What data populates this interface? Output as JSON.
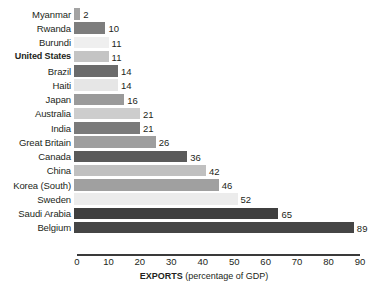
{
  "chart_data": {
    "type": "bar",
    "orientation": "horizontal",
    "title": "",
    "subtitle": "",
    "xlabel": "EXPORTS (percentage of GDP)",
    "xlabel_bold_part": "EXPORTS",
    "xlabel_plain_part": " (percentage of GDP)",
    "ylabel": "",
    "xlim": [
      0,
      90
    ],
    "xticks": [
      0,
      10,
      20,
      30,
      40,
      50,
      60,
      70,
      80,
      90
    ],
    "xtick_labels": [
      "0",
      "10",
      "20",
      "30",
      "40",
      "50",
      "60",
      "70",
      "80",
      "90"
    ],
    "grid": false,
    "legend": false,
    "categories": [
      "Myanmar",
      "Rwanda",
      "Burundi",
      "United States",
      "Brazil",
      "Haiti",
      "Japan",
      "Australia",
      "India",
      "Great Britain",
      "Canada",
      "China",
      "Korea (South)",
      "Sweden",
      "Saudi Arabia",
      "Belgium"
    ],
    "values": [
      2,
      10,
      11,
      11,
      14,
      14,
      16,
      21,
      21,
      26,
      36,
      42,
      46,
      52,
      65,
      89
    ],
    "value_labels": [
      "2",
      "10",
      "11",
      "11",
      "14",
      "14",
      "16",
      "21",
      "21",
      "26",
      "36",
      "42",
      "46",
      "52",
      "65",
      "89"
    ],
    "bar_colors": [
      "#a3a3a3",
      "#7d7d7d",
      "#efefef",
      "#c4c4c4",
      "#6b6b6b",
      "#e6e6e6",
      "#9a9a9a",
      "#cdcdcd",
      "#7a7a7a",
      "#9e9e9e",
      "#5a5a5a",
      "#c0c0c0",
      "#a0a0a0",
      "#ececec",
      "#3f3f3f",
      "#454545"
    ],
    "highlight_category": "United States"
  }
}
